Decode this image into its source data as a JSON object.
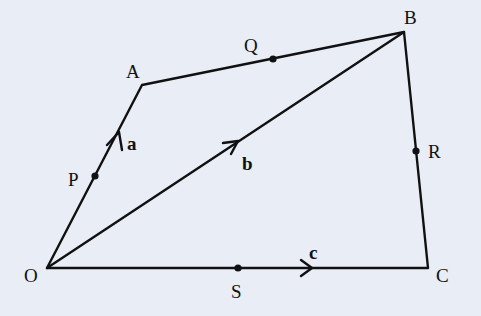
{
  "diagram": {
    "background": "#e8edf6",
    "line_color": "#111111",
    "points": {
      "O": {
        "label": "O",
        "x": 47,
        "y": 268
      },
      "A": {
        "label": "A",
        "x": 142,
        "y": 85
      },
      "B": {
        "label": "B",
        "x": 404,
        "y": 32
      },
      "C": {
        "label": "C",
        "x": 428,
        "y": 268
      },
      "P": {
        "label": "P",
        "x": 95,
        "y": 176
      },
      "Q": {
        "label": "Q",
        "x": 273,
        "y": 59
      },
      "R": {
        "label": "R",
        "x": 416,
        "y": 151
      },
      "S": {
        "label": "S",
        "x": 238,
        "y": 268
      }
    },
    "segments": [
      "OA",
      "AB",
      "BC",
      "OC",
      "OB"
    ],
    "vectors": [
      {
        "label": "a",
        "along": "OA"
      },
      {
        "label": "b",
        "along": "OB"
      },
      {
        "label": "c",
        "along": "OC"
      }
    ]
  }
}
